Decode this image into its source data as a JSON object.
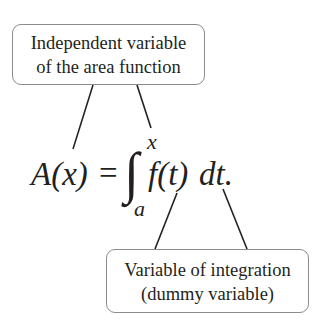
{
  "labels": {
    "top": {
      "line1": "Independent variable",
      "line2": "of the area function"
    },
    "bottom": {
      "line1": "Variable of integration",
      "line2": "(dummy variable)"
    }
  },
  "equation": {
    "lhs": "A(x)",
    "equals": "=",
    "integral_sign": "∫",
    "upper_limit": "x",
    "lower_limit": "a",
    "integrand": "f(t)",
    "differential": "dt."
  },
  "colors": {
    "text": "#231f20",
    "box_border": "#8c8c8c",
    "connector": "#231f20"
  }
}
